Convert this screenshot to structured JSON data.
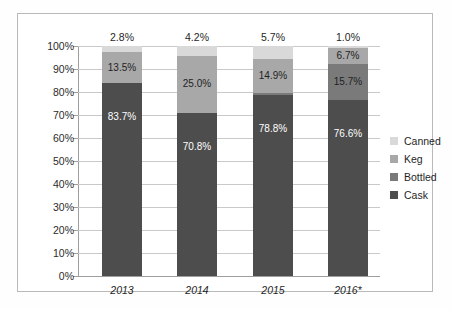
{
  "chart_data": {
    "type": "bar",
    "subtype": "100% stacked column",
    "title": "",
    "xlabel": "",
    "ylabel": "",
    "ylim": [
      0,
      100
    ],
    "ytick_labels": [
      "0%",
      "10%",
      "20%",
      "30%",
      "40%",
      "50%",
      "60%",
      "70%",
      "80%",
      "90%",
      "100%"
    ],
    "ytick_values": [
      0,
      10,
      20,
      30,
      40,
      50,
      60,
      70,
      80,
      90,
      100
    ],
    "grid": true,
    "legend_position": "right",
    "categories": [
      "2013",
      "2014",
      "2015",
      "2016*"
    ],
    "series": [
      {
        "name": "Cask",
        "color": "#4d4d4d",
        "values": [
          83.7,
          70.8,
          78.8,
          76.6
        ]
      },
      {
        "name": "Bottled",
        "color": "#7a7a7a",
        "values": [
          0.0,
          0.0,
          0.6,
          0.0
        ]
      },
      {
        "name": "Keg",
        "color": "#a8a8a8",
        "values": [
          13.5,
          25.0,
          14.9,
          15.7
        ]
      },
      {
        "name": "Canned",
        "color": "#d9d9d9",
        "values": [
          2.8,
          4.2,
          5.7,
          6.7
        ]
      }
    ],
    "data_labels": {
      "cask": [
        "83.7%",
        "70.8%",
        "78.8%",
        "76.6%"
      ],
      "keg": [
        "13.5%",
        "25.0%",
        "14.9%",
        "15.7%"
      ],
      "canned": [
        "2.8%",
        "4.2%",
        "5.7%",
        "6.7%"
      ],
      "above": [
        "2.8%",
        "4.2%",
        "5.7%",
        "1.0%"
      ]
    },
    "legend_entries": [
      "Canned",
      "Keg",
      "Bottled",
      "Cask"
    ]
  },
  "legend": {
    "items": [
      {
        "label": "Canned",
        "color": "#d9d9d9"
      },
      {
        "label": "Keg",
        "color": "#a8a8a8"
      },
      {
        "label": "Bottled",
        "color": "#7a7a7a"
      },
      {
        "label": "Cask",
        "color": "#4d4d4d"
      }
    ]
  },
  "axis": {
    "y_ticks": [
      "100%",
      "90%",
      "80%",
      "70%",
      "60%",
      "50%",
      "40%",
      "30%",
      "20%",
      "10%",
      "0%"
    ],
    "x_ticks": [
      "2013",
      "2014",
      "2015",
      "2016*"
    ]
  },
  "bars": [
    {
      "category": "2013",
      "above_label": "2.8%",
      "segments": [
        {
          "series": "canned",
          "pct": 2.8,
          "label": "",
          "label_color": "light"
        },
        {
          "series": "keg",
          "pct": 13.5,
          "label": "13.5%",
          "label_color": "light"
        },
        {
          "series": "cask",
          "pct": 83.7,
          "label": "83.7%",
          "label_color": "dark"
        }
      ]
    },
    {
      "category": "2014",
      "above_label": "4.2%",
      "segments": [
        {
          "series": "canned",
          "pct": 4.2,
          "label": "",
          "label_color": "light"
        },
        {
          "series": "keg",
          "pct": 25.0,
          "label": "25.0%",
          "label_color": "light"
        },
        {
          "series": "cask",
          "pct": 70.8,
          "label": "70.8%",
          "label_color": "dark"
        }
      ]
    },
    {
      "category": "2015",
      "above_label": "5.7%",
      "segments": [
        {
          "series": "canned",
          "pct": 5.7,
          "label": "",
          "label_color": "light"
        },
        {
          "series": "keg",
          "pct": 14.9,
          "label": "14.9%",
          "label_color": "light"
        },
        {
          "series": "bottled",
          "pct": 0.6,
          "label": "",
          "label_color": "dark"
        },
        {
          "series": "cask",
          "pct": 78.8,
          "label": "78.8%",
          "label_color": "dark"
        }
      ]
    },
    {
      "category": "2016*",
      "above_label": "1.0%",
      "segments": [
        {
          "series": "canned",
          "pct": 1.0,
          "label": "",
          "label_color": "light"
        },
        {
          "series": "keg",
          "pct": 6.7,
          "label": "6.7%",
          "label_color": "light"
        },
        {
          "series": "bottled",
          "pct": 15.7,
          "label": "15.7%",
          "label_color": "light"
        },
        {
          "series": "cask",
          "pct": 76.6,
          "label": "76.6%",
          "label_color": "dark"
        }
      ]
    }
  ]
}
